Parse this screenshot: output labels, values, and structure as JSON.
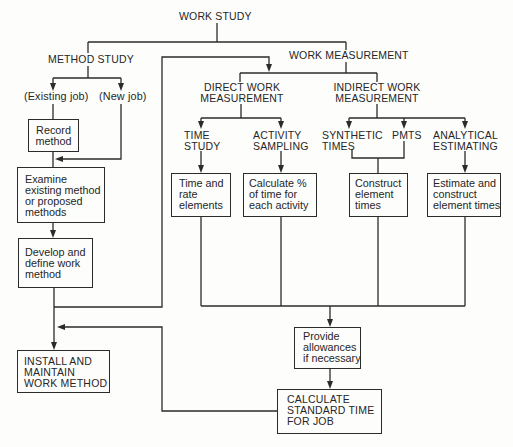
{
  "title": "WORK STUDY",
  "method_study": {
    "label": "METHOD STUDY",
    "existing_job": "(Existing job)",
    "new_job": "(New job)",
    "record_method": [
      "Record",
      "method"
    ],
    "examine": [
      "Examine",
      "existing method",
      "or proposed",
      "methods"
    ],
    "develop": [
      "Develop and",
      "define work",
      "method"
    ],
    "install": [
      "INSTALL AND",
      "MAINTAIN",
      "WORK METHOD"
    ]
  },
  "work_measurement": {
    "label": "WORK MEASUREMENT",
    "direct": {
      "label": [
        "DIRECT WORK",
        "MEASUREMENT"
      ],
      "time_study": {
        "label": [
          "TIME",
          "STUDY"
        ],
        "box": [
          "Time and",
          "rate",
          "elements"
        ]
      },
      "activity_sampling": {
        "label": [
          "ACTIVITY",
          "SAMPLING"
        ],
        "box": [
          "Calculate %",
          "of time for",
          "each activity"
        ]
      }
    },
    "indirect": {
      "label": [
        "INDIRECT WORK",
        "MEASUREMENT"
      ],
      "synthetic_times": [
        "SYNTHETIC",
        "TIMES"
      ],
      "pmts": "PMTS",
      "construct_box": [
        "Construct",
        "element",
        "times"
      ],
      "analytical_estimating": {
        "label": [
          "ANALYTICAL",
          "ESTIMATING"
        ],
        "box": [
          "Estimate and",
          "construct",
          "element times"
        ]
      }
    },
    "allowances": [
      "Provide",
      "allowances",
      "if necessary"
    ],
    "standard_time": [
      "CALCULATE",
      "STANDARD TIME",
      "FOR JOB"
    ]
  },
  "colors": {
    "line": "#2b2b2b",
    "background": "#fdfdfc",
    "text": "#262626"
  }
}
